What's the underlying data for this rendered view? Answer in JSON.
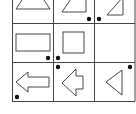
{
  "puzzle": {
    "type": "3x3 shape-and-dot matrix",
    "grid": {
      "rows": 3,
      "cols": 3,
      "line_color": "#444444",
      "background": "#ffffff"
    },
    "cells": [
      {
        "row": 1,
        "col": 1,
        "shape": "triangle",
        "dots": []
      },
      {
        "row": 1,
        "col": 2,
        "shape": "right-trapezoid",
        "dots": [
          "bottom-right-outside"
        ]
      },
      {
        "row": 1,
        "col": 3,
        "shape": "right-triangle",
        "dots": [
          "bottom-left-outside"
        ]
      },
      {
        "row": 2,
        "col": 1,
        "shape": "rectangle",
        "dots": [
          "bottom-right"
        ]
      },
      {
        "row": 2,
        "col": 2,
        "shape": "square",
        "dots": [
          "bottom-left",
          "top-left-below-line"
        ]
      },
      {
        "row": 2,
        "col": 3,
        "shape": "empty",
        "dots": []
      },
      {
        "row": 3,
        "col": 1,
        "shape": "left-arrow",
        "dots": [
          "bottom-left"
        ]
      },
      {
        "row": 3,
        "col": 2,
        "shape": "short-left-arrow",
        "dots": []
      },
      {
        "row": 3,
        "col": 3,
        "shape": "left-triangle",
        "dots": [
          "top-right"
        ]
      }
    ],
    "dot_color": "#111111",
    "stroke_color": "#333333"
  }
}
